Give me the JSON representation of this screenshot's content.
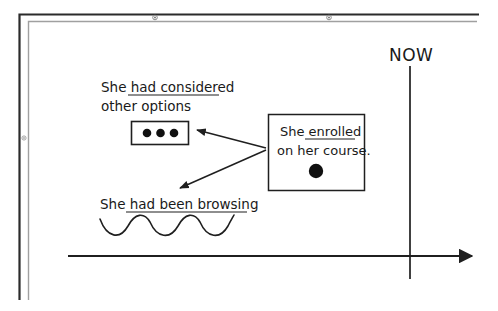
{
  "diagram": {
    "timeline": {
      "now_label": "NOW",
      "axis_direction": "left-to-right",
      "axis_arrow": "right-arrow-icon",
      "now_marker": "vertical-line"
    },
    "annotations": [
      {
        "id": "considered",
        "line1": "She had considered ",
        "line2": "other options",
        "underlined_part": "had considered",
        "aspect_symbol": "three-dots-in-box",
        "dot_count": 3
      },
      {
        "id": "enrolled",
        "line1": "She enrolled",
        "line2": "on her course.",
        "underlined_part": "enrolled",
        "aspect_symbol": "single-filled-dot-in-box",
        "dot_count": 1
      },
      {
        "id": "browsing",
        "line1": "She had been browsing",
        "underlined_part": "had been browsing",
        "aspect_symbol": "wavy-line",
        "wave_cycles": 3
      }
    ],
    "arrows": [
      {
        "from": "enrolled",
        "to": "considered"
      },
      {
        "from": "enrolled",
        "to": "browsing"
      }
    ],
    "colors": {
      "ink": "#1a1a1a",
      "frame_dark": "#2b2b2b",
      "frame_light": "#9a9a9a",
      "background": "#ffffff"
    }
  }
}
